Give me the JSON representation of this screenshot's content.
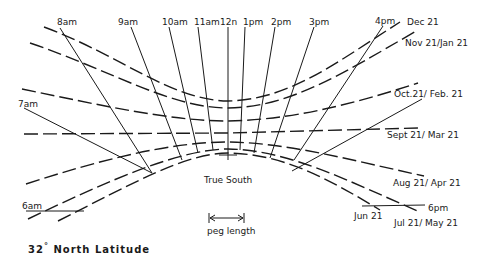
{
  "diagram": {
    "latitude_label": "32",
    "latitude_degree": "°",
    "latitude_suffix": "North Latitude",
    "center_label": "True South",
    "scale_label": "peg length",
    "colors": {
      "ink": "#1a1a1a",
      "background": "#ffffff"
    },
    "hour_lines": [
      {
        "label": "8am"
      },
      {
        "label": "9am"
      },
      {
        "label": "10am"
      },
      {
        "label": "11am"
      },
      {
        "label": "12n"
      },
      {
        "label": "1pm"
      },
      {
        "label": "2pm"
      },
      {
        "label": "3pm"
      },
      {
        "label": "4pm"
      },
      {
        "label": "7am"
      },
      {
        "label": "6am"
      },
      {
        "label": "6pm"
      }
    ],
    "date_lines": [
      {
        "label": "Dec 21"
      },
      {
        "label": "Nov 21/Jan 21"
      },
      {
        "label": "Oct.21/ Feb. 21"
      },
      {
        "label": "Sept 21/ Mar 21"
      },
      {
        "label": "Aug 21/ Apr 21"
      },
      {
        "label": "Jun 21"
      },
      {
        "label": "Jul 21/ May 21"
      }
    ]
  }
}
